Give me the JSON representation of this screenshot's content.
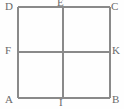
{
  "figure": {
    "type": "geometric-diagram",
    "background_color": "#fefefe",
    "line_color": "#8a8a8a",
    "label_color": "#6a6a6a",
    "square": {
      "left": 18,
      "top": 7,
      "right": 110,
      "bottom": 98
    },
    "midlines": {
      "horizontal_y": 52,
      "vertical_x": 63
    },
    "labels": [
      {
        "id": "D",
        "text": "D",
        "x": 5,
        "y": 1,
        "role": "top-left-corner"
      },
      {
        "id": "E",
        "text": "E",
        "x": 57,
        "y": -3,
        "role": "top-midpoint"
      },
      {
        "id": "C",
        "text": "C",
        "x": 111,
        "y": 1,
        "role": "top-right-corner"
      },
      {
        "id": "F",
        "text": "F",
        "x": 5,
        "y": 45,
        "role": "left-midpoint"
      },
      {
        "id": "K",
        "text": "K",
        "x": 112,
        "y": 45,
        "role": "right-midpoint"
      },
      {
        "id": "A",
        "text": "A",
        "x": 5,
        "y": 94,
        "role": "bottom-left-corner"
      },
      {
        "id": "I",
        "text": "I",
        "x": 59,
        "y": 97,
        "role": "bottom-midpoint"
      },
      {
        "id": "B",
        "text": "B",
        "x": 112,
        "y": 94,
        "role": "bottom-right-corner"
      }
    ]
  }
}
